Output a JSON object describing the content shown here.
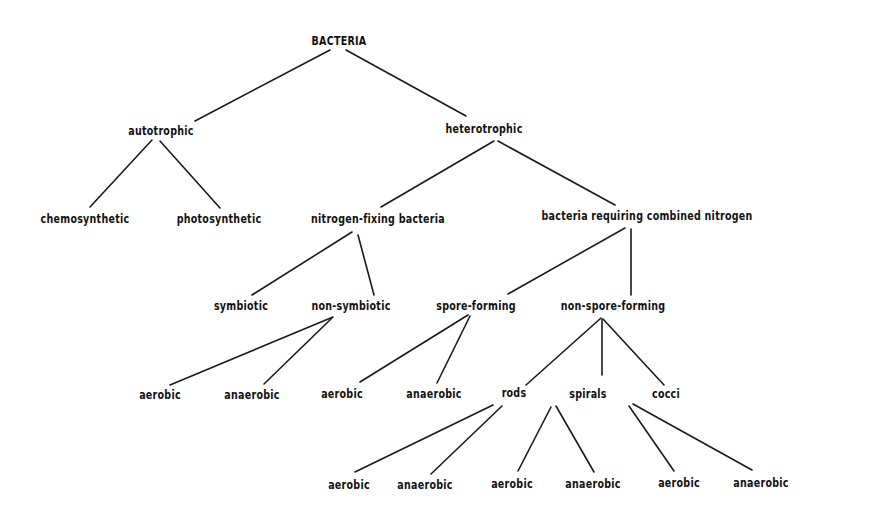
{
  "diagram": {
    "type": "classification-tree",
    "root": "BACTERIA",
    "nodes": [
      {
        "id": "n0",
        "label": "BACTERIA",
        "x": 339,
        "y": 41
      },
      {
        "id": "n1",
        "label": "autotrophic",
        "x": 161,
        "y": 131
      },
      {
        "id": "n2",
        "label": "heterotrophic",
        "x": 484,
        "y": 129
      },
      {
        "id": "n3",
        "label": "chemosynthetic",
        "x": 85,
        "y": 219
      },
      {
        "id": "n4",
        "label": "photosynthetic",
        "x": 219,
        "y": 219
      },
      {
        "id": "n5",
        "label": "nitrogen-fixing bacteria",
        "x": 378,
        "y": 219
      },
      {
        "id": "n6",
        "label": "bacteria requiring combined nitrogen",
        "x": 647,
        "y": 216
      },
      {
        "id": "n7",
        "label": "symbiotic",
        "x": 241,
        "y": 306
      },
      {
        "id": "n8",
        "label": "non-symbiotic",
        "x": 351,
        "y": 306
      },
      {
        "id": "n9",
        "label": "spore-forming",
        "x": 476,
        "y": 306
      },
      {
        "id": "n10",
        "label": "non-spore-forming",
        "x": 613,
        "y": 306
      },
      {
        "id": "n11",
        "label": "aerobic",
        "x": 160,
        "y": 395
      },
      {
        "id": "n12",
        "label": "anaerobic",
        "x": 252,
        "y": 395
      },
      {
        "id": "n13",
        "label": "aerobic",
        "x": 342,
        "y": 394
      },
      {
        "id": "n14",
        "label": "anaerobic",
        "x": 434,
        "y": 394
      },
      {
        "id": "n15",
        "label": "rods",
        "x": 514,
        "y": 393
      },
      {
        "id": "n16",
        "label": "spirals",
        "x": 588,
        "y": 394
      },
      {
        "id": "n17",
        "label": "cocci",
        "x": 666,
        "y": 394
      },
      {
        "id": "n18",
        "label": "aerobic",
        "x": 349,
        "y": 485
      },
      {
        "id": "n19",
        "label": "anaerobic",
        "x": 425,
        "y": 485
      },
      {
        "id": "n20",
        "label": "aerobic",
        "x": 512,
        "y": 484
      },
      {
        "id": "n21",
        "label": "anaerobic",
        "x": 593,
        "y": 484
      },
      {
        "id": "n22",
        "label": "aerobic",
        "x": 679,
        "y": 483
      },
      {
        "id": "n23",
        "label": "anaerobic",
        "x": 761,
        "y": 483
      }
    ],
    "edges": [
      {
        "from": "n0",
        "to": "n1",
        "x1": 330,
        "y1": 50,
        "x2": 195,
        "y2": 121
      },
      {
        "from": "n0",
        "to": "n2",
        "x1": 346,
        "y1": 50,
        "x2": 466,
        "y2": 116
      },
      {
        "from": "n1",
        "to": "n3",
        "x1": 152,
        "y1": 140,
        "x2": 90,
        "y2": 207
      },
      {
        "from": "n1",
        "to": "n4",
        "x1": 160,
        "y1": 141,
        "x2": 220,
        "y2": 208
      },
      {
        "from": "n2",
        "to": "n5",
        "x1": 494,
        "y1": 141,
        "x2": 381,
        "y2": 207
      },
      {
        "from": "n2",
        "to": "n6",
        "x1": 498,
        "y1": 141,
        "x2": 615,
        "y2": 205
      },
      {
        "from": "n5",
        "to": "n7",
        "x1": 352,
        "y1": 232,
        "x2": 252,
        "y2": 295
      },
      {
        "from": "n5",
        "to": "n8",
        "x1": 358,
        "y1": 235,
        "x2": 374,
        "y2": 295
      },
      {
        "from": "n6",
        "to": "n9",
        "x1": 625,
        "y1": 228,
        "x2": 508,
        "y2": 294
      },
      {
        "from": "n6",
        "to": "n10",
        "x1": 631,
        "y1": 229,
        "x2": 631,
        "y2": 295
      },
      {
        "from": "n8",
        "to": "n11",
        "x1": 333,
        "y1": 317,
        "x2": 170,
        "y2": 385
      },
      {
        "from": "n8",
        "to": "n12",
        "x1": 332,
        "y1": 318,
        "x2": 264,
        "y2": 384
      },
      {
        "from": "n9",
        "to": "n13",
        "x1": 468,
        "y1": 315,
        "x2": 360,
        "y2": 382
      },
      {
        "from": "n9",
        "to": "n14",
        "x1": 470,
        "y1": 316,
        "x2": 437,
        "y2": 383
      },
      {
        "from": "n10",
        "to": "n15",
        "x1": 601,
        "y1": 318,
        "x2": 526,
        "y2": 385
      },
      {
        "from": "n10",
        "to": "n16",
        "x1": 602,
        "y1": 319,
        "x2": 602,
        "y2": 375
      },
      {
        "from": "n10",
        "to": "n17",
        "x1": 603,
        "y1": 319,
        "x2": 664,
        "y2": 385
      },
      {
        "from": "n15",
        "to": "n18",
        "x1": 493,
        "y1": 405,
        "x2": 355,
        "y2": 472
      },
      {
        "from": "n15",
        "to": "n19",
        "x1": 502,
        "y1": 406,
        "x2": 431,
        "y2": 474
      },
      {
        "from": "n16",
        "to": "n20",
        "x1": 551,
        "y1": 407,
        "x2": 518,
        "y2": 471
      },
      {
        "from": "n16",
        "to": "n21",
        "x1": 556,
        "y1": 406,
        "x2": 594,
        "y2": 472
      },
      {
        "from": "n17",
        "to": "n22",
        "x1": 629,
        "y1": 406,
        "x2": 674,
        "y2": 471
      },
      {
        "from": "n17",
        "to": "n23",
        "x1": 633,
        "y1": 404,
        "x2": 752,
        "y2": 470
      }
    ]
  }
}
